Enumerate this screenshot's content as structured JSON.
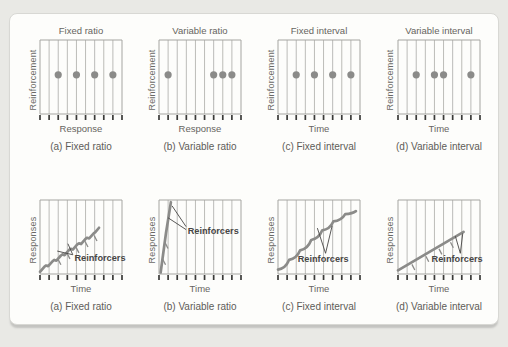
{
  "figure": {
    "background": "#e9e9e5",
    "card_background": "#fdfdfb",
    "card_border": "#d8d8d4",
    "shadow": "#c3c3c0"
  },
  "colors": {
    "grid": "#a5a5a1",
    "tick": "#3a3a38",
    "marker": "#8b8b89",
    "label": "#666460",
    "annotation": "#474645"
  },
  "chart_data": [
    {
      "type": "scatter",
      "row": "top",
      "title": "Fixed ratio",
      "ylabel": "Reinforcement",
      "xlabel": "Response",
      "caption": "(a) Fixed ratio",
      "gridline_count": 10,
      "dot_lines": [
        2,
        4,
        6,
        8
      ],
      "dot_y": 0.53
    },
    {
      "type": "scatter",
      "row": "top",
      "title": "Variable ratio",
      "ylabel": "Reinforcement",
      "xlabel": "Response",
      "caption": "(b) Variable ratio",
      "gridline_count": 10,
      "dot_lines": [
        1,
        6,
        7,
        8
      ],
      "dot_y": 0.53
    },
    {
      "type": "scatter",
      "row": "top",
      "title": "Fixed interval",
      "ylabel": "Reinforcement",
      "xlabel": "Time",
      "caption": "(c) Fixed interval",
      "gridline_count": 10,
      "dot_lines": [
        2,
        4,
        6,
        8
      ],
      "dot_y": 0.53
    },
    {
      "type": "scatter",
      "row": "top",
      "title": "Variable interval",
      "ylabel": "Reinforcement",
      "xlabel": "Time",
      "caption": "(d) Variable interval",
      "gridline_count": 10,
      "dot_lines": [
        2,
        4,
        5,
        8
      ],
      "dot_y": 0.53
    },
    {
      "type": "line",
      "row": "bottom",
      "ylabel": "Responses",
      "xlabel": "Time",
      "caption": "(a) Fixed ratio",
      "gridline_count": 10,
      "curve": {
        "kind": "steps",
        "points": [
          [
            0.0,
            0.03
          ],
          [
            0.055,
            0.1
          ],
          [
            0.075,
            0.115
          ],
          [
            0.1,
            0.105
          ],
          [
            0.155,
            0.175
          ],
          [
            0.175,
            0.19
          ],
          [
            0.2,
            0.18
          ],
          [
            0.255,
            0.25
          ],
          [
            0.275,
            0.265
          ],
          [
            0.3,
            0.255
          ],
          [
            0.355,
            0.325
          ],
          [
            0.375,
            0.34
          ],
          [
            0.4,
            0.33
          ],
          [
            0.455,
            0.4
          ],
          [
            0.475,
            0.415
          ],
          [
            0.5,
            0.405
          ],
          [
            0.555,
            0.475
          ],
          [
            0.575,
            0.49
          ],
          [
            0.6,
            0.48
          ],
          [
            0.655,
            0.55
          ],
          [
            0.675,
            0.565
          ],
          [
            0.72,
            0.625
          ]
        ]
      },
      "hatches": [
        [
          0.22,
          0.2
        ],
        [
          0.33,
          0.28
        ],
        [
          0.44,
          0.36
        ],
        [
          0.55,
          0.44
        ],
        [
          0.66,
          0.52
        ]
      ],
      "annotation": {
        "label": "Reinforcers",
        "text_pos": [
          0.42,
          0.22
        ],
        "leaders": [
          [
            [
              0.4,
              0.26
            ],
            [
              0.21,
              0.31
            ]
          ],
          [
            [
              0.4,
              0.26
            ],
            [
              0.34,
              0.41
            ]
          ]
        ]
      }
    },
    {
      "type": "line",
      "row": "bottom",
      "ylabel": "Responses",
      "xlabel": "Time",
      "caption": "(b) Variable ratio",
      "gridline_count": 10,
      "curve": {
        "kind": "steps",
        "points": [
          [
            0.02,
            0.02
          ],
          [
            0.085,
            0.55
          ],
          [
            0.145,
            0.97
          ]
        ]
      },
      "hatches": [
        [
          0.045,
          0.2
        ],
        [
          0.075,
          0.42
        ]
      ],
      "annotation": {
        "label": "Reinforcers",
        "text_pos": [
          0.35,
          0.58
        ],
        "leaders": [
          [
            [
              0.33,
              0.64
            ],
            [
              0.16,
              0.92
            ]
          ],
          [
            [
              0.33,
              0.6
            ],
            [
              0.11,
              0.76
            ]
          ]
        ]
      }
    },
    {
      "type": "line",
      "row": "bottom",
      "ylabel": "Responses",
      "xlabel": "Time",
      "caption": "(c) Fixed interval",
      "gridline_count": 10,
      "curve": {
        "kind": "scallops",
        "points": [
          [
            0.0,
            0.06
          ],
          [
            0.135,
            0.19
          ],
          [
            0.27,
            0.32
          ],
          [
            0.405,
            0.46
          ],
          [
            0.54,
            0.59
          ],
          [
            0.675,
            0.71
          ],
          [
            0.82,
            0.81
          ],
          [
            0.95,
            0.85
          ]
        ]
      },
      "hatches": [],
      "annotation": {
        "label": "Reinforcers",
        "text_pos": [
          0.24,
          0.2
        ],
        "leaders": [
          [
            [
              0.58,
              0.28
            ],
            [
              0.48,
              0.62
            ]
          ],
          [
            [
              0.58,
              0.28
            ],
            [
              0.66,
              0.65
            ]
          ]
        ]
      }
    },
    {
      "type": "line",
      "row": "bottom",
      "ylabel": "Responses",
      "xlabel": "Time",
      "caption": "(d) Variable interval",
      "gridline_count": 10,
      "curve": {
        "kind": "steps",
        "points": [
          [
            0.0,
            0.05
          ],
          [
            0.8,
            0.57
          ]
        ]
      },
      "hatches": [
        [
          0.17,
          0.13
        ],
        [
          0.34,
          0.24
        ],
        [
          0.5,
          0.34
        ],
        [
          0.64,
          0.43
        ]
      ],
      "annotation": {
        "label": "Reinforcers",
        "text_pos": [
          0.41,
          0.2
        ],
        "leaders": [
          [
            [
              0.76,
              0.28
            ],
            [
              0.7,
              0.51
            ]
          ],
          [
            [
              0.76,
              0.28
            ],
            [
              0.79,
              0.55
            ]
          ]
        ]
      }
    }
  ]
}
